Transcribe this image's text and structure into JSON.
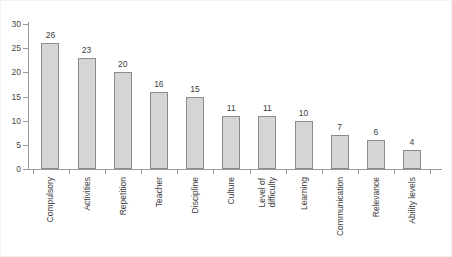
{
  "chart_data": {
    "type": "bar",
    "title": "",
    "subtitle": "",
    "xlabel": "",
    "ylabel": "",
    "ylim": [
      0,
      30
    ],
    "yticks": [
      0,
      5,
      10,
      15,
      20,
      25,
      30
    ],
    "grid": false,
    "legend": false,
    "orientation": "vertical",
    "bar_color": "#d5d5d5",
    "bar_border_color": "#8c8c8c",
    "axis_color": "#9a9a9a",
    "text_color": "#3c3c3c",
    "categories": [
      "Compulsory",
      "Activities",
      "Repetition",
      "Teacher",
      "Discipline",
      "Culture",
      "Level of\ndifficulty",
      "Learning",
      "Communication",
      "Relevance",
      "Ability levels"
    ],
    "values": [
      26,
      23,
      20,
      16,
      15,
      11,
      11,
      10,
      7,
      6,
      4
    ],
    "data_labels": [
      "26",
      "23",
      "20",
      "16",
      "15",
      "11",
      "11",
      "10",
      "7",
      "6",
      "4"
    ],
    "ytick_labels": [
      "0",
      "5",
      "10",
      "15",
      "20",
      "25",
      "30"
    ]
  }
}
